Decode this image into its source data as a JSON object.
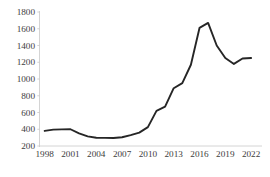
{
  "chart_data": {
    "type": "line",
    "title": "",
    "subtitle": "",
    "xlabel": "",
    "ylabel": "",
    "x": [
      1998,
      1999,
      2000,
      2001,
      2002,
      2003,
      2004,
      2005,
      2006,
      2007,
      2008,
      2009,
      2010,
      2011,
      2012,
      2013,
      2014,
      2015,
      2016,
      2017,
      2018,
      2019,
      2020,
      2021,
      2022
    ],
    "values": [
      380,
      395,
      398,
      400,
      350,
      315,
      298,
      297,
      295,
      305,
      330,
      360,
      425,
      620,
      670,
      890,
      950,
      1170,
      1610,
      1670,
      1400,
      1250,
      1180,
      1245,
      1250
    ],
    "series": [
      {
        "name": "series-1",
        "values": [
          380,
          395,
          398,
          400,
          350,
          315,
          298,
          297,
          295,
          305,
          330,
          360,
          425,
          620,
          670,
          890,
          950,
          1170,
          1610,
          1670,
          1400,
          1250,
          1180,
          1245,
          1250
        ]
      }
    ],
    "xticks": [
      "1998",
      "2001",
      "2004",
      "2007",
      "2010",
      "2013",
      "2016",
      "2019",
      "2022"
    ],
    "xtick_values": [
      1998,
      2001,
      2004,
      2007,
      2010,
      2013,
      2016,
      2019,
      2022
    ],
    "yticks": [
      "200",
      "400",
      "600",
      "800",
      "1000",
      "1200",
      "1400",
      "1600",
      "1800"
    ],
    "ytick_values": [
      200,
      400,
      600,
      800,
      1000,
      1200,
      1400,
      1600,
      1800
    ],
    "xlim": [
      1997.4,
      2022.8
    ],
    "ylim": [
      200,
      1800
    ],
    "grid": false,
    "legend": null,
    "line_color": "#262626",
    "tick_color": "#3d3d3d",
    "axis_color": "#c9c9c9",
    "background": "#ffffff"
  },
  "caption": {
    "text": ""
  }
}
